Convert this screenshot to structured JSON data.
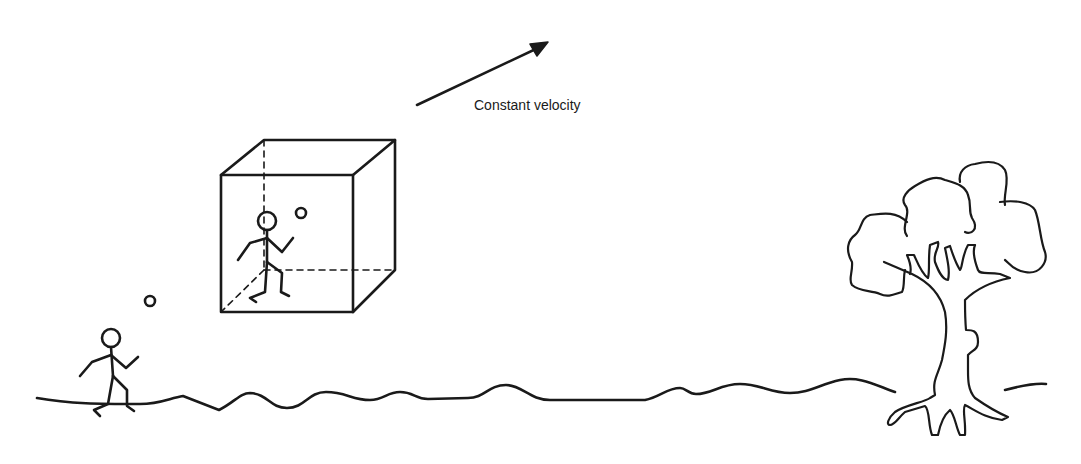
{
  "diagram": {
    "velocity_label": "Constant velocity",
    "stroke_color": "#1a1a1a",
    "background": "#ffffff",
    "elements": [
      {
        "name": "velocity-arrow",
        "description": "Arrow pointing up-right indicating motion"
      },
      {
        "name": "moving-box",
        "description": "Transparent cube (wireframe with dashed hidden edges) moving at constant velocity"
      },
      {
        "name": "person-in-box",
        "description": "Stick figure inside cube tossing a ball"
      },
      {
        "name": "ball-in-box",
        "description": "Small ball inside cube"
      },
      {
        "name": "person-on-ground",
        "description": "Stick figure standing on ground tossing a ball"
      },
      {
        "name": "ball-on-ground",
        "description": "Small ball above ground figure"
      },
      {
        "name": "tree",
        "description": "Outlined tree with roots on the right"
      },
      {
        "name": "ground-line",
        "description": "Wavy horizon line"
      }
    ]
  }
}
